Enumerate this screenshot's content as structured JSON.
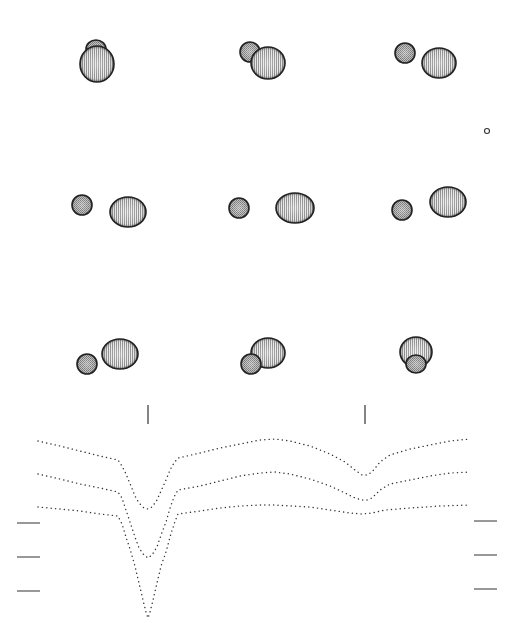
{
  "figure": {
    "background": "#ffffff",
    "ink_color": "#333333",
    "panels": [
      {
        "row": 0,
        "col": 0,
        "primary": {
          "cx": 97,
          "cy": 64,
          "rx": 17,
          "ry": 18
        },
        "secondary": {
          "cx": 96,
          "cy": 49,
          "rx": 10,
          "ry": 9
        },
        "secondary_front": false
      },
      {
        "row": 0,
        "col": 1,
        "primary": {
          "cx": 268,
          "cy": 63,
          "rx": 17,
          "ry": 16
        },
        "secondary": {
          "cx": 250,
          "cy": 52,
          "rx": 10,
          "ry": 10
        },
        "secondary_front": false
      },
      {
        "row": 0,
        "col": 2,
        "primary": {
          "cx": 439,
          "cy": 63,
          "rx": 17,
          "ry": 15
        },
        "secondary": {
          "cx": 405,
          "cy": 53,
          "rx": 10,
          "ry": 10
        },
        "secondary_front": true
      },
      {
        "row": 1,
        "col": 0,
        "primary": {
          "cx": 128,
          "cy": 212,
          "rx": 18,
          "ry": 15
        },
        "secondary": {
          "cx": 82,
          "cy": 205,
          "rx": 10,
          "ry": 10
        },
        "secondary_front": true
      },
      {
        "row": 1,
        "col": 1,
        "primary": {
          "cx": 295,
          "cy": 208,
          "rx": 19,
          "ry": 15
        },
        "secondary": {
          "cx": 239,
          "cy": 208,
          "rx": 10,
          "ry": 10
        },
        "secondary_front": true
      },
      {
        "row": 1,
        "col": 2,
        "primary": {
          "cx": 448,
          "cy": 202,
          "rx": 18,
          "ry": 15
        },
        "secondary": {
          "cx": 402,
          "cy": 210,
          "rx": 10,
          "ry": 10
        },
        "secondary_front": true
      },
      {
        "row": 2,
        "col": 0,
        "primary": {
          "cx": 120,
          "cy": 354,
          "rx": 18,
          "ry": 15
        },
        "secondary": {
          "cx": 87,
          "cy": 364,
          "rx": 10,
          "ry": 10
        },
        "secondary_front": true
      },
      {
        "row": 2,
        "col": 1,
        "primary": {
          "cx": 268,
          "cy": 353,
          "rx": 17,
          "ry": 15
        },
        "secondary": {
          "cx": 251,
          "cy": 364,
          "rx": 10,
          "ry": 10
        },
        "secondary_front": true
      },
      {
        "row": 2,
        "col": 2,
        "primary": {
          "cx": 416,
          "cy": 352,
          "rx": 16,
          "ry": 15
        },
        "secondary": {
          "cx": 416,
          "cy": 364,
          "rx": 10,
          "ry": 9
        },
        "secondary_front": true
      }
    ],
    "small_marker": {
      "cx": 487,
      "cy": 131,
      "r": 2.5
    },
    "phase_ticks": [
      {
        "x": 148,
        "y1": 405,
        "y2": 424
      },
      {
        "x": 365,
        "y1": 405,
        "y2": 424
      }
    ],
    "scale_bars_left": [
      {
        "x1": 17,
        "x2": 40,
        "y": 523
      },
      {
        "x1": 17,
        "x2": 40,
        "y": 557
      },
      {
        "x1": 17,
        "x2": 40,
        "y": 591
      }
    ],
    "scale_bars_right": [
      {
        "x1": 474,
        "x2": 497,
        "y": 521
      },
      {
        "x1": 474,
        "x2": 497,
        "y": 555
      },
      {
        "x1": 474,
        "x2": 497,
        "y": 589
      }
    ]
  },
  "chart_data": {
    "type": "scatter",
    "title": "",
    "xlabel": "",
    "ylabel": "",
    "note": "Three model light curves (dotted), vertically offset; primary eclipse near x=148 px, secondary eclipse near x=365 px. Values are pixel coordinates (y increases downward).",
    "series": [
      {
        "name": "curve-1",
        "points": [
          [
            38,
            441
          ],
          [
            60,
            446
          ],
          [
            80,
            451
          ],
          [
            100,
            456
          ],
          [
            118,
            460
          ],
          [
            122,
            466
          ],
          [
            126,
            474
          ],
          [
            131,
            486
          ],
          [
            135,
            496
          ],
          [
            139,
            503
          ],
          [
            144,
            508
          ],
          [
            148,
            509
          ],
          [
            152,
            507
          ],
          [
            157,
            500
          ],
          [
            161,
            491
          ],
          [
            166,
            480
          ],
          [
            170,
            470
          ],
          [
            174,
            463
          ],
          [
            178,
            458
          ],
          [
            200,
            453
          ],
          [
            220,
            448
          ],
          [
            240,
            444
          ],
          [
            260,
            440
          ],
          [
            275,
            439
          ],
          [
            290,
            441
          ],
          [
            310,
            446
          ],
          [
            330,
            454
          ],
          [
            345,
            462
          ],
          [
            355,
            470
          ],
          [
            362,
            475
          ],
          [
            367,
            475
          ],
          [
            372,
            472
          ],
          [
            380,
            462
          ],
          [
            390,
            455
          ],
          [
            410,
            449
          ],
          [
            430,
            445
          ],
          [
            450,
            441
          ],
          [
            470,
            439
          ]
        ]
      },
      {
        "name": "curve-2",
        "points": [
          [
            38,
            474
          ],
          [
            60,
            479
          ],
          [
            80,
            484
          ],
          [
            100,
            488
          ],
          [
            118,
            492
          ],
          [
            122,
            498
          ],
          [
            126,
            510
          ],
          [
            131,
            525
          ],
          [
            135,
            537
          ],
          [
            139,
            548
          ],
          [
            144,
            555
          ],
          [
            148,
            558
          ],
          [
            152,
            555
          ],
          [
            157,
            547
          ],
          [
            161,
            535
          ],
          [
            166,
            522
          ],
          [
            170,
            508
          ],
          [
            174,
            497
          ],
          [
            178,
            490
          ],
          [
            200,
            486
          ],
          [
            220,
            481
          ],
          [
            240,
            476
          ],
          [
            260,
            473
          ],
          [
            275,
            472
          ],
          [
            290,
            474
          ],
          [
            310,
            479
          ],
          [
            330,
            486
          ],
          [
            345,
            493
          ],
          [
            355,
            498
          ],
          [
            362,
            500
          ],
          [
            367,
            500
          ],
          [
            372,
            498
          ],
          [
            380,
            490
          ],
          [
            390,
            484
          ],
          [
            410,
            480
          ],
          [
            430,
            476
          ],
          [
            450,
            473
          ],
          [
            470,
            472
          ]
        ]
      },
      {
        "name": "curve-3",
        "points": [
          [
            38,
            507
          ],
          [
            60,
            509
          ],
          [
            80,
            511
          ],
          [
            100,
            514
          ],
          [
            118,
            516
          ],
          [
            122,
            524
          ],
          [
            126,
            537
          ],
          [
            131,
            552
          ],
          [
            135,
            566
          ],
          [
            139,
            583
          ],
          [
            143,
            600
          ],
          [
            146,
            612
          ],
          [
            148,
            618
          ],
          [
            150,
            612
          ],
          [
            153,
            600
          ],
          [
            157,
            583
          ],
          [
            161,
            566
          ],
          [
            166,
            552
          ],
          [
            170,
            537
          ],
          [
            174,
            524
          ],
          [
            178,
            514
          ],
          [
            200,
            511
          ],
          [
            220,
            508
          ],
          [
            240,
            506
          ],
          [
            260,
            505
          ],
          [
            275,
            505
          ],
          [
            290,
            506
          ],
          [
            310,
            507
          ],
          [
            330,
            510
          ],
          [
            350,
            513
          ],
          [
            362,
            514
          ],
          [
            372,
            513
          ],
          [
            385,
            510
          ],
          [
            410,
            508
          ],
          [
            440,
            506
          ],
          [
            470,
            505
          ]
        ]
      }
    ]
  }
}
